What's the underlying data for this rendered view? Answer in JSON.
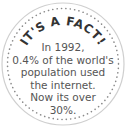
{
  "badge": {
    "heading": "IT'S A FACT!",
    "lines": [
      "In 1992,",
      "0.4% of the world's",
      "population used",
      "the internet.",
      "Now its over",
      "30%."
    ],
    "colors": {
      "text": "#555555",
      "heading": "#333333",
      "outline": "#cfcfcf",
      "dots": "#8a8a8a",
      "background": "#ffffff"
    }
  }
}
